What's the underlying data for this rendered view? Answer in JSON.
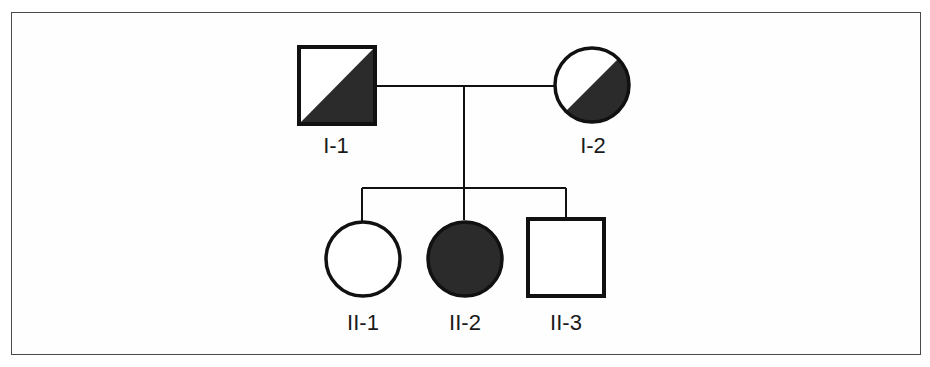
{
  "diagram": {
    "type": "pedigree",
    "colors": {
      "line": "#111111",
      "affected_fill": "#2b2b2b",
      "unaffected_fill": "#ffffff",
      "frame": "#4a4a4a"
    },
    "generations": [
      {
        "roman": "I",
        "individuals": [
          {
            "id": "I-1",
            "label": "I-1",
            "sex": "male",
            "shape": "square",
            "status": "carrier (half-shaded diagonal)"
          },
          {
            "id": "I-2",
            "label": "I-2",
            "sex": "female",
            "shape": "circle",
            "status": "carrier (half-shaded diagonal)"
          }
        ]
      },
      {
        "roman": "II",
        "individuals": [
          {
            "id": "II-1",
            "label": "II-1",
            "sex": "female",
            "shape": "circle",
            "status": "unaffected"
          },
          {
            "id": "II-2",
            "label": "II-2",
            "sex": "female",
            "shape": "circle",
            "status": "affected"
          },
          {
            "id": "II-3",
            "label": "II-3",
            "sex": "male",
            "shape": "square",
            "status": "unaffected"
          }
        ]
      }
    ],
    "relationships": [
      {
        "type": "mating",
        "partners": [
          "I-1",
          "I-2"
        ]
      },
      {
        "type": "offspring",
        "parents": [
          "I-1",
          "I-2"
        ],
        "children": [
          "II-1",
          "II-2",
          "II-3"
        ]
      }
    ]
  },
  "labels": {
    "i1": "I-1",
    "i2": "I-2",
    "ii1": "II-1",
    "ii2": "II-2",
    "ii3": "II-3"
  }
}
